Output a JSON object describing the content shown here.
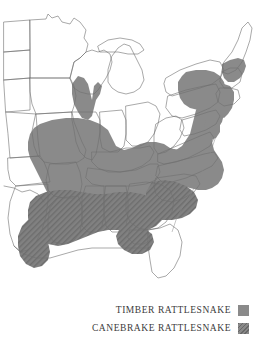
{
  "figure": {
    "type": "range-map",
    "region": "Eastern United States",
    "background_color": "#ffffff",
    "outline_color": "#7a7a7a",
    "state_border_color": "#4a4a4a"
  },
  "legend": {
    "items": [
      {
        "label": "TIMBER RATTLESNAKE",
        "swatch_name": "timber-swatch",
        "color": "#8a8a8a",
        "fill_style": "solid"
      },
      {
        "label": "CANEBRAKE RATTLESNAKE",
        "swatch_name": "canebrake-swatch",
        "color": "#7c7c7c",
        "fill_style": "diagonal-hatch"
      }
    ]
  },
  "map_data": {
    "type": "choropleth-range",
    "title": "",
    "series": [
      {
        "name": "TIMBER RATTLESNAKE",
        "color": "#8a8a8a",
        "fill_style": "solid",
        "regions": [
          "Minnesota (southeast)",
          "Wisconsin (southwest)",
          "Iowa (east)",
          "Illinois",
          "Missouri",
          "Kansas (east)",
          "Oklahoma (east)",
          "Arkansas",
          "Indiana (south)",
          "Ohio (south)",
          "Kentucky",
          "Tennessee",
          "West Virginia",
          "Virginia",
          "Pennsylvania",
          "New York (southeast)",
          "New Jersey",
          "Connecticut",
          "Massachusetts (west)",
          "Vermont (south)",
          "New Hampshire (south)",
          "Maryland (west)",
          "North Carolina (mountains)",
          "South Carolina (upstate)",
          "Georgia (north)",
          "Alabama (north)"
        ]
      },
      {
        "name": "CANEBRAKE RATTLESNAKE",
        "color": "#7c7c7c",
        "fill_style": "diagonal-hatch",
        "regions": [
          "Texas (east)",
          "Louisiana",
          "Mississippi",
          "Alabama (south)",
          "Georgia (south)",
          "Florida (north panhandle)",
          "South Carolina (coastal plain)",
          "North Carolina (coastal plain)",
          "Virginia (southeast)",
          "Arkansas (south)"
        ]
      }
    ],
    "unshaded_regions": [
      "North Dakota",
      "South Dakota",
      "Nebraska",
      "Michigan",
      "Wisconsin (north)",
      "Minnesota (north)",
      "Ohio (north)",
      "Indiana (north)",
      "Maine",
      "Florida (peninsula)"
    ]
  }
}
